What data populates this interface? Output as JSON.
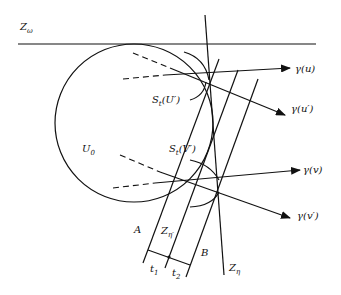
{
  "figure": {
    "labels": {
      "z_omega": "Z",
      "z_omega_sub": "ω",
      "u0": "U",
      "u0_sub": "0",
      "s_u": "S",
      "s_u_sub": "t",
      "s_u_arg": "(U′)",
      "s_v": "S",
      "s_v_sub": "t",
      "s_v_arg": "(V′)",
      "gamma_u": "γ(u)",
      "gamma_u_prime": "γ(u′)",
      "gamma_v": "γ(v)",
      "gamma_v_prime": "γ(v′)",
      "a": "A",
      "b": "B",
      "z_eta_prime": "Z",
      "z_eta_prime_sub": "η′",
      "z_eta": "Z",
      "z_eta_sub": "η",
      "t1": "t",
      "t1_sub": "1",
      "t2": "t",
      "t2_sub": "2"
    },
    "colors": {
      "ink": "#111111",
      "background": "#ffffff"
    }
  }
}
